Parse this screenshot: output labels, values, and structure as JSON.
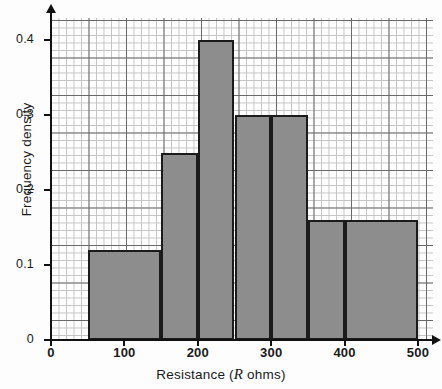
{
  "chart_data": {
    "type": "bar",
    "title": "",
    "xlabel": "Resistance (R ohms)",
    "xlabel_parts": {
      "pre": "Resistance (",
      "italic": "R",
      "post": " ohms)"
    },
    "ylabel": "Frequency density",
    "xlim": [
      0,
      500
    ],
    "ylim": [
      0,
      0.44
    ],
    "grid": true,
    "grid_minor_step_x": 10,
    "grid_minor_step_y": 0.01,
    "grid_major_step_x": 50,
    "grid_major_step_y": 0.05,
    "legend": "none",
    "xticks": [
      0,
      100,
      200,
      300,
      400,
      500
    ],
    "xtick_labels": [
      "0",
      "100",
      "200",
      "300",
      "400",
      "500"
    ],
    "yticks": [
      0,
      0.1,
      0.2,
      0.3,
      0.4
    ],
    "ytick_labels": [
      "0",
      "0.1",
      "0.2",
      "0.3",
      "0.4"
    ],
    "bar_fill_color": "#8d8d8d",
    "bar_edge_color": "#1b1b1b",
    "bins": [
      {
        "name": "bin-50-150",
        "start": 50,
        "end": 150,
        "value": 0.12
      },
      {
        "name": "bin-150-200",
        "start": 150,
        "end": 200,
        "value": 0.25
      },
      {
        "name": "bin-200-250",
        "start": 200,
        "end": 250,
        "value": 0.4
      },
      {
        "name": "bin-250-300",
        "start": 250,
        "end": 300,
        "value": 0.3
      },
      {
        "name": "bin-300-350",
        "start": 300,
        "end": 350,
        "value": 0.3
      },
      {
        "name": "bin-350-400",
        "start": 350,
        "end": 400,
        "value": 0.16
      },
      {
        "name": "bin-400-500",
        "start": 400,
        "end": 500,
        "value": 0.16
      }
    ],
    "categories": [
      "50-150",
      "150-200",
      "200-250",
      "250-300",
      "300-350",
      "350-400",
      "400-500"
    ],
    "values": [
      0.12,
      0.25,
      0.4,
      0.3,
      0.3,
      0.16,
      0.16
    ]
  }
}
